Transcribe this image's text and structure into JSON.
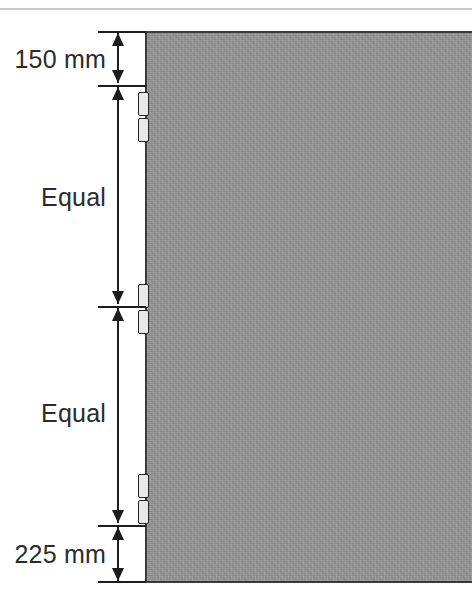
{
  "diagram": {
    "units": "mm",
    "panel": {
      "name": "door-panel",
      "fill_color": "#949494",
      "outline_color": "#3a3a3a"
    },
    "hinges": [
      {
        "id": "hinge-top",
        "label": "Top hinge"
      },
      {
        "id": "hinge-middle",
        "label": "Middle hinge"
      },
      {
        "id": "hinge-bottom",
        "label": "Bottom hinge"
      }
    ],
    "dimensions": [
      {
        "id": "dim-top",
        "label": "150 mm",
        "value": 150,
        "unit": "mm",
        "from": "top of door",
        "to": "top hinge"
      },
      {
        "id": "dim-equal-upper",
        "label": "Equal",
        "value": null,
        "unit": "",
        "from": "top hinge",
        "to": "middle hinge"
      },
      {
        "id": "dim-equal-lower",
        "label": "Equal",
        "value": null,
        "unit": "",
        "from": "middle hinge",
        "to": "bottom hinge"
      },
      {
        "id": "dim-bottom",
        "label": "225 mm",
        "value": 225,
        "unit": "mm",
        "from": "bottom hinge",
        "to": "bottom of door"
      }
    ]
  }
}
